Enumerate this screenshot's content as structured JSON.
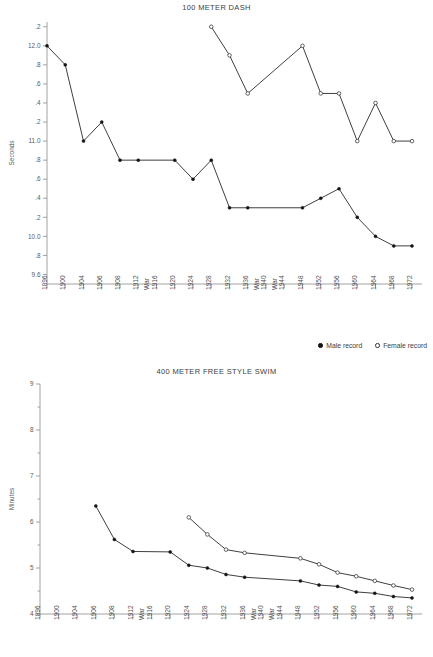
{
  "legend": {
    "male": {
      "label": "Male record",
      "marker": "filled-circle"
    },
    "female": {
      "label": "Female record",
      "marker": "open-circle"
    }
  },
  "war_label": "War",
  "chart_data": [
    {
      "type": "line",
      "id": "dash",
      "title": "100 METER DASH",
      "xlabel": "",
      "ylabel": "Seconds",
      "ylim": [
        9.5,
        12.25
      ],
      "yticks": [
        12.2,
        12.0,
        11.8,
        11.6,
        11.4,
        11.2,
        11.0,
        10.8,
        10.6,
        10.4,
        10.2,
        10.0,
        9.8,
        9.6
      ],
      "ytick_labels": [
        ".2",
        "12.0",
        ".8",
        ".6",
        ".4",
        ".2",
        "11.0",
        ".8",
        ".6",
        ".4",
        ".2",
        "10.0",
        ".8",
        "9.6"
      ],
      "x": [
        1896,
        1900,
        1904,
        1906,
        1908,
        1912,
        1916,
        1920,
        1924,
        1928,
        1932,
        1936,
        1940,
        1944,
        1948,
        1952,
        1956,
        1960,
        1964,
        1968,
        1972
      ],
      "xtick_labels": [
        "1896",
        "1900",
        "1904",
        "1906",
        "1908",
        "1912",
        "1916",
        "1920",
        "1924",
        "1928",
        "1932",
        "1936",
        "1940",
        "1944",
        "1948",
        "1952",
        "1956",
        "1960",
        "1964",
        "1968",
        "1972"
      ],
      "war_years": [
        1916,
        1940,
        1944
      ],
      "grid": false,
      "legend_position": "below-right",
      "series": [
        {
          "name": "Male record",
          "marker": "filled-circle",
          "points": [
            {
              "x": 1896,
              "y": 12.0
            },
            {
              "x": 1900,
              "y": 11.8
            },
            {
              "x": 1904,
              "y": 11.0
            },
            {
              "x": 1906,
              "y": 11.2
            },
            {
              "x": 1908,
              "y": 10.8
            },
            {
              "x": 1912,
              "y": 10.8
            },
            {
              "x": 1920,
              "y": 10.8
            },
            {
              "x": 1924,
              "y": 10.6
            },
            {
              "x": 1928,
              "y": 10.8
            },
            {
              "x": 1932,
              "y": 10.3
            },
            {
              "x": 1936,
              "y": 10.3
            },
            {
              "x": 1948,
              "y": 10.3
            },
            {
              "x": 1952,
              "y": 10.4
            },
            {
              "x": 1956,
              "y": 10.5
            },
            {
              "x": 1960,
              "y": 10.2
            },
            {
              "x": 1964,
              "y": 10.0
            },
            {
              "x": 1968,
              "y": 9.9
            },
            {
              "x": 1972,
              "y": 9.9
            }
          ]
        },
        {
          "name": "Female record",
          "marker": "open-circle",
          "points": [
            {
              "x": 1928,
              "y": 12.2
            },
            {
              "x": 1932,
              "y": 11.9
            },
            {
              "x": 1936,
              "y": 11.5
            },
            {
              "x": 1948,
              "y": 12.0
            },
            {
              "x": 1952,
              "y": 11.5
            },
            {
              "x": 1956,
              "y": 11.5
            },
            {
              "x": 1960,
              "y": 11.0
            },
            {
              "x": 1964,
              "y": 11.4
            },
            {
              "x": 1968,
              "y": 11.0
            },
            {
              "x": 1972,
              "y": 11.0
            }
          ]
        }
      ]
    },
    {
      "type": "line",
      "id": "swim",
      "title": "400 METER FREE STYLE SWIM",
      "xlabel": "",
      "ylabel": "Minutes",
      "ylim": [
        4.0,
        9.0
      ],
      "yticks": [
        9,
        8,
        7,
        6,
        5,
        4
      ],
      "ytick_labels": [
        "9",
        "8",
        "7",
        "6",
        "5",
        "4"
      ],
      "x": [
        1896,
        1900,
        1904,
        1906,
        1908,
        1912,
        1916,
        1920,
        1924,
        1928,
        1932,
        1936,
        1940,
        1944,
        1948,
        1952,
        1956,
        1960,
        1964,
        1968,
        1972
      ],
      "xtick_labels": [
        "1896",
        "1900",
        "1904",
        "1906",
        "1908",
        "1912",
        "1916",
        "1920",
        "1924",
        "1928",
        "1932",
        "1936",
        "1940",
        "1944",
        "1948",
        "1952",
        "1956",
        "1960",
        "1964",
        "1968",
        "1972"
      ],
      "war_years": [
        1916,
        1940,
        1944
      ],
      "grid": false,
      "legend_position": "none",
      "series": [
        {
          "name": "Male record",
          "marker": "filled-circle",
          "points": [
            {
              "x": 1906,
              "y": 6.35
            },
            {
              "x": 1908,
              "y": 5.62
            },
            {
              "x": 1912,
              "y": 5.36
            },
            {
              "x": 1920,
              "y": 5.35
            },
            {
              "x": 1924,
              "y": 5.06
            },
            {
              "x": 1928,
              "y": 5.0
            },
            {
              "x": 1932,
              "y": 4.86
            },
            {
              "x": 1936,
              "y": 4.8
            },
            {
              "x": 1948,
              "y": 4.72
            },
            {
              "x": 1952,
              "y": 4.63
            },
            {
              "x": 1956,
              "y": 4.6
            },
            {
              "x": 1960,
              "y": 4.48
            },
            {
              "x": 1964,
              "y": 4.45
            },
            {
              "x": 1968,
              "y": 4.38
            },
            {
              "x": 1972,
              "y": 4.35
            }
          ]
        },
        {
          "name": "Female record",
          "marker": "open-circle",
          "points": [
            {
              "x": 1924,
              "y": 6.1
            },
            {
              "x": 1928,
              "y": 5.73
            },
            {
              "x": 1932,
              "y": 5.4
            },
            {
              "x": 1936,
              "y": 5.33
            },
            {
              "x": 1948,
              "y": 5.21
            },
            {
              "x": 1952,
              "y": 5.08
            },
            {
              "x": 1956,
              "y": 4.9
            },
            {
              "x": 1960,
              "y": 4.82
            },
            {
              "x": 1964,
              "y": 4.72
            },
            {
              "x": 1968,
              "y": 4.62
            },
            {
              "x": 1972,
              "y": 4.53
            }
          ]
        }
      ]
    }
  ]
}
